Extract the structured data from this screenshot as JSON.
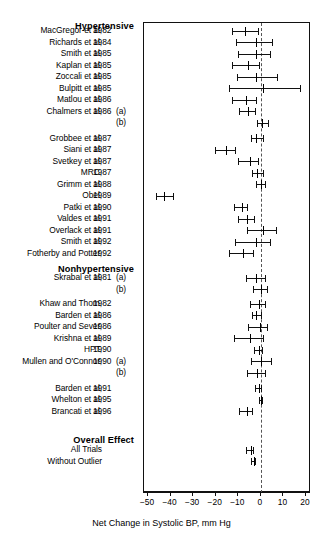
{
  "figure": {
    "axis_label": "Net Change in Systolic BP, mm Hg",
    "x_ticks": [
      "−50",
      "−40",
      "−30",
      "−20",
      "−10",
      "0",
      "10",
      "20"
    ],
    "x_tick_values": [
      -50,
      -40,
      -30,
      -20,
      -10,
      0,
      10,
      20
    ],
    "zero_reference": 0
  },
  "sections": [
    {
      "id": "hypertensive",
      "label": "Hypertensive"
    },
    {
      "id": "nonhypertensive",
      "label": "Nonhypertensive"
    },
    {
      "id": "overall",
      "label": "Overall Effect"
    }
  ],
  "chart_data": {
    "type": "forest",
    "title": "",
    "xlabel": "Net Change in Systolic BP, mm Hg",
    "ylabel": "",
    "xlim": [
      -50,
      20
    ],
    "xticks": [
      -50,
      -40,
      -30,
      -20,
      -10,
      0,
      10,
      20
    ],
    "grid": false,
    "reference_line": 0,
    "legend": "none",
    "groups": [
      {
        "name": "Hypertensive",
        "rows": [
          {
            "study": "MacGregor et al,",
            "year": "1982",
            "suffix": "",
            "estimate": -7.0,
            "ci_low": -12.8,
            "ci_high": -1.0
          },
          {
            "study": "Richards et al,",
            "year": "1984",
            "suffix": "",
            "estimate": -2.0,
            "ci_low": -11.0,
            "ci_high": 5.5
          },
          {
            "study": "Smith et al,",
            "year": "1985",
            "suffix": "",
            "estimate": -2.0,
            "ci_low": -10.0,
            "ci_high": 4.5
          },
          {
            "study": "Kaplan et al,",
            "year": "1985",
            "suffix": "",
            "estimate": -5.5,
            "ci_low": -13.0,
            "ci_high": -0.2
          },
          {
            "study": "Zoccali et al,",
            "year": "1985",
            "suffix": "",
            "estimate": -2.0,
            "ci_low": -10.5,
            "ci_high": 7.5
          },
          {
            "study": "Bulpitt et al,",
            "year": "1985",
            "suffix": "",
            "estimate": 1.0,
            "ci_low": -14.0,
            "ci_high": 18.0
          },
          {
            "study": "Matlou et al,",
            "year": "1986",
            "suffix": "",
            "estimate": -6.5,
            "ci_low": -12.8,
            "ci_high": -1.5
          },
          {
            "study": "Chalmers et al,",
            "year": "1986",
            "suffix": "(a)",
            "estimate": -5.5,
            "ci_low": -9.5,
            "ci_high": -2.0
          },
          {
            "study": "",
            "year": "",
            "suffix": "(b)",
            "estimate": 0.5,
            "ci_low": -1.5,
            "ci_high": 3.5
          },
          {
            "study": "Grobbee et al,",
            "year": "1987",
            "suffix": "",
            "estimate": -2.0,
            "ci_low": -4.5,
            "ci_high": 1.5
          },
          {
            "study": "Siani et al,",
            "year": "1987",
            "suffix": "",
            "estimate": -15.5,
            "ci_low": -20.5,
            "ci_high": -11.0
          },
          {
            "study": "Svetkey et al,",
            "year": "1987",
            "suffix": "",
            "estimate": -5.0,
            "ci_low": -10.0,
            "ci_high": -1.0
          },
          {
            "study": "MRC,",
            "year": "1987",
            "suffix": "",
            "estimate": -1.5,
            "ci_low": -4.0,
            "ci_high": 1.5
          },
          {
            "study": "Grimm et al,",
            "year": "1988",
            "suffix": "",
            "estimate": 0.0,
            "ci_low": -2.0,
            "ci_high": 2.5
          },
          {
            "study": "Obel,",
            "year": "1989",
            "suffix": "",
            "estimate": -43.0,
            "ci_low": -46.5,
            "ci_high": -38.5
          },
          {
            "study": "Patki et al,",
            "year": "1990",
            "suffix": "",
            "estimate": -8.5,
            "ci_low": -12.0,
            "ci_high": -5.5
          },
          {
            "study": "Valdes et al,",
            "year": "1991",
            "suffix": "",
            "estimate": -6.0,
            "ci_low": -10.0,
            "ci_high": -2.5
          },
          {
            "study": "Overlack et al,",
            "year": "1991",
            "suffix": "",
            "estimate": 1.0,
            "ci_low": -6.0,
            "ci_high": 7.0
          },
          {
            "study": "Smith et al,",
            "year": "1992",
            "suffix": "",
            "estimate": -2.0,
            "ci_low": -11.5,
            "ci_high": 4.5
          },
          {
            "study": "Fotherby and Potter,",
            "year": "1992",
            "suffix": "",
            "estimate": -8.0,
            "ci_low": -14.0,
            "ci_high": -3.0
          }
        ]
      },
      {
        "name": "Nonhypertensive",
        "rows": [
          {
            "study": "Skrabal et al,",
            "year": "1981",
            "suffix": "(a)",
            "estimate": -2.0,
            "ci_low": -6.5,
            "ci_high": 2.5
          },
          {
            "study": "",
            "year": "",
            "suffix": "(b)",
            "estimate": 0.0,
            "ci_low": -3.5,
            "ci_high": 3.0
          },
          {
            "study": "Khaw and Thom,",
            "year": "1982",
            "suffix": "",
            "estimate": -1.0,
            "ci_low": -5.0,
            "ci_high": 2.5
          },
          {
            "study": "Barden et al,",
            "year": "1986",
            "suffix": "",
            "estimate": -2.0,
            "ci_low": -4.0,
            "ci_high": 0.5
          },
          {
            "study": "Poulter and Sever,",
            "year": "1986",
            "suffix": "",
            "estimate": -0.5,
            "ci_low": -5.5,
            "ci_high": 3.0
          },
          {
            "study": "Krishna et al,",
            "year": "1989",
            "suffix": "",
            "estimate": -5.0,
            "ci_low": -12.0,
            "ci_high": 1.5
          },
          {
            "study": "HPT,",
            "year": "1990",
            "suffix": "",
            "estimate": -1.0,
            "ci_low": -3.0,
            "ci_high": 1.0
          },
          {
            "study": "Mullen and O'Connor,",
            "year": "1990",
            "suffix": "(a)",
            "estimate": 0.0,
            "ci_low": -4.5,
            "ci_high": 5.0
          },
          {
            "study": "",
            "year": "",
            "suffix": "(b)",
            "estimate": -1.5,
            "ci_low": -6.0,
            "ci_high": 2.5
          },
          {
            "study": "Barden et al,",
            "year": "1991",
            "suffix": "",
            "estimate": -1.0,
            "ci_low": -2.5,
            "ci_high": 0.5
          },
          {
            "study": "Whelton et al,",
            "year": "1995",
            "suffix": "",
            "estimate": 0.0,
            "ci_low": -1.0,
            "ci_high": 1.0
          },
          {
            "study": "Brancati et al,",
            "year": "1996",
            "suffix": "",
            "estimate": -6.0,
            "ci_low": -9.5,
            "ci_high": -3.5
          }
        ]
      },
      {
        "name": "Overall Effect",
        "rows": [
          {
            "study": "All Trials",
            "year": "",
            "suffix": "",
            "estimate": -4.5,
            "ci_low": -6.5,
            "ci_high": -3.0
          },
          {
            "study": "Without Outlier",
            "year": "",
            "suffix": "",
            "estimate": -3.0,
            "ci_low": -4.5,
            "ci_high": -2.0
          }
        ]
      }
    ]
  }
}
